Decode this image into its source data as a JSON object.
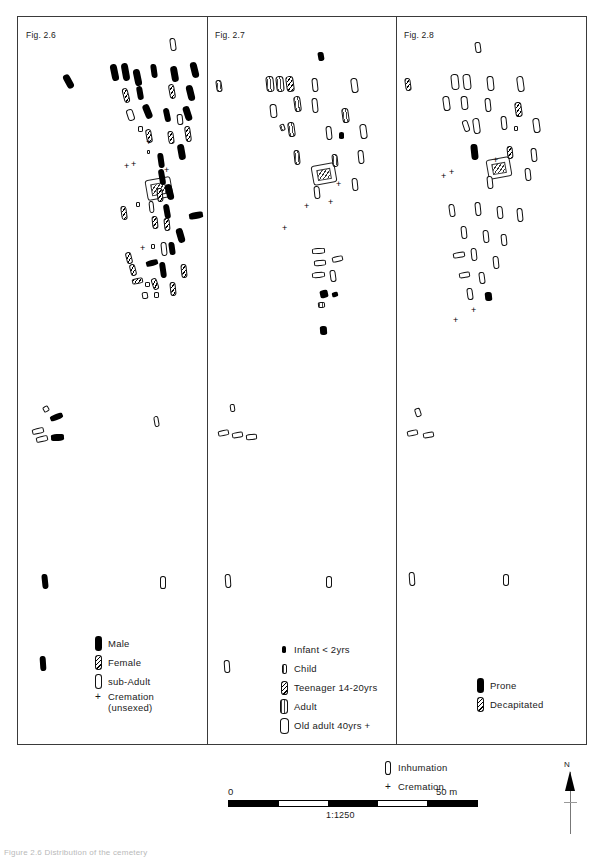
{
  "figure": {
    "caption": "Figure 2.6  Distribution of the cemetery",
    "scale": {
      "zero_label": "0",
      "max_label": "50 m",
      "ratio": "1:1250"
    },
    "north": {
      "label": "N",
      "icon": "north-arrow-icon"
    }
  },
  "panels": [
    {
      "id": "fig-2-6",
      "label": "Fig. 2.6",
      "legend_title": "sex",
      "legend": [
        {
          "symbol": "solid",
          "label": "Male"
        },
        {
          "symbol": "hatch",
          "label": "Female"
        },
        {
          "symbol": "open",
          "label": "sub-Adult"
        },
        {
          "symbol": "plus",
          "label": "Cremation\n(unsexed)"
        }
      ]
    },
    {
      "id": "fig-2-7",
      "label": "Fig. 2.7",
      "legend_title": "age",
      "legend": [
        {
          "symbol": "solid-small",
          "label": "Infant < 2yrs"
        },
        {
          "symbol": "open-small",
          "label": "Child"
        },
        {
          "symbol": "hatch",
          "label": "Teenager 14-20yrs"
        },
        {
          "symbol": "dotty",
          "label": "Adult"
        },
        {
          "symbol": "open",
          "label": "Old adult 40yrs +"
        }
      ]
    },
    {
      "id": "fig-2-8",
      "label": "Fig. 2.8",
      "legend_title": "rite",
      "legend": [
        {
          "symbol": "solid",
          "label": "Prone"
        },
        {
          "symbol": "hatch",
          "label": "Decapitated"
        }
      ]
    }
  ],
  "shared_legend": [
    {
      "symbol": "open",
      "label": "Inhumation"
    },
    {
      "symbol": "plus",
      "label": "Cremation"
    }
  ],
  "chart_data": {
    "type": "scatter",
    "panel_1_graves": [
      {
        "x": 47,
        "y": 58,
        "w": 7,
        "h": 15,
        "r": -28,
        "t": "solid"
      },
      {
        "x": 93,
        "y": 48,
        "w": 7,
        "h": 17,
        "r": -12,
        "t": "solid"
      },
      {
        "x": 104,
        "y": 47,
        "w": 7,
        "h": 18,
        "r": -10,
        "t": "solid"
      },
      {
        "x": 116,
        "y": 53,
        "w": 7,
        "h": 17,
        "r": -12,
        "t": "solid"
      },
      {
        "x": 133,
        "y": 48,
        "w": 6,
        "h": 14,
        "r": -8,
        "t": "solid"
      },
      {
        "x": 152,
        "y": 22,
        "w": 6,
        "h": 13,
        "r": -8,
        "t": "open"
      },
      {
        "x": 153,
        "y": 50,
        "w": 7,
        "h": 16,
        "r": -10,
        "t": "solid"
      },
      {
        "x": 173,
        "y": 46,
        "w": 7,
        "h": 16,
        "r": -14,
        "t": "solid"
      },
      {
        "x": 105,
        "y": 72,
        "w": 6,
        "h": 15,
        "r": -14,
        "t": "hatch"
      },
      {
        "x": 119,
        "y": 70,
        "w": 6,
        "h": 14,
        "r": -10,
        "t": "solid"
      },
      {
        "x": 151,
        "y": 68,
        "w": 6,
        "h": 15,
        "r": -10,
        "t": "hatch"
      },
      {
        "x": 169,
        "y": 69,
        "w": 7,
        "h": 16,
        "r": -14,
        "t": "solid"
      },
      {
        "x": 126,
        "y": 88,
        "w": 7,
        "h": 15,
        "r": -22,
        "t": "solid"
      },
      {
        "x": 109,
        "y": 93,
        "w": 7,
        "h": 12,
        "r": -18,
        "t": "open"
      },
      {
        "x": 146,
        "y": 92,
        "w": 6,
        "h": 14,
        "r": -12,
        "t": "solid"
      },
      {
        "x": 166,
        "y": 90,
        "w": 7,
        "h": 15,
        "r": -18,
        "t": "solid"
      },
      {
        "x": 159,
        "y": 98,
        "w": 6,
        "h": 11,
        "r": -6,
        "t": "open"
      },
      {
        "x": 128,
        "y": 113,
        "w": 6,
        "h": 14,
        "r": -10,
        "t": "hatch"
      },
      {
        "x": 150,
        "y": 115,
        "w": 6,
        "h": 13,
        "r": -8,
        "t": "hatch"
      },
      {
        "x": 167,
        "y": 110,
        "w": 6,
        "h": 16,
        "r": -8,
        "t": "hatch"
      },
      {
        "x": 120,
        "y": 110,
        "w": 5,
        "h": 6,
        "r": 0,
        "t": "open"
      },
      {
        "x": 160,
        "y": 128,
        "w": 7,
        "h": 16,
        "r": -10,
        "t": "solid"
      },
      {
        "x": 129,
        "y": 134,
        "w": 3,
        "h": 4,
        "r": 0,
        "t": "open"
      },
      {
        "x": 140,
        "y": 137,
        "w": 6,
        "h": 15,
        "r": -8,
        "t": "solid"
      },
      {
        "x": 141,
        "y": 153,
        "w": 6,
        "h": 16,
        "r": -10,
        "t": "solid"
      },
      {
        "x": 148,
        "y": 168,
        "w": 7,
        "h": 16,
        "r": -14,
        "t": "solid"
      },
      {
        "x": 139,
        "y": 172,
        "w": 6,
        "h": 14,
        "r": -6,
        "t": "hatch"
      },
      {
        "x": 103,
        "y": 190,
        "w": 6,
        "h": 14,
        "r": -8,
        "t": "hatch"
      },
      {
        "x": 131,
        "y": 185,
        "w": 5,
        "h": 12,
        "r": -6,
        "t": "open"
      },
      {
        "x": 146,
        "y": 188,
        "w": 6,
        "h": 15,
        "r": -10,
        "t": "solid"
      },
      {
        "x": 118,
        "y": 186,
        "w": 4,
        "h": 5,
        "r": 0,
        "t": "open"
      },
      {
        "x": 134,
        "y": 200,
        "w": 6,
        "h": 13,
        "r": -6,
        "t": "hatch"
      },
      {
        "x": 146,
        "y": 202,
        "w": 6,
        "h": 13,
        "r": -6,
        "t": "hatch"
      },
      {
        "x": 171,
        "y": 196,
        "w": 14,
        "h": 7,
        "r": -10,
        "t": "solid"
      },
      {
        "x": 159,
        "y": 212,
        "w": 7,
        "h": 15,
        "r": -16,
        "t": "solid"
      },
      {
        "x": 133,
        "y": 228,
        "w": 4,
        "h": 5,
        "r": 0,
        "t": "open"
      },
      {
        "x": 143,
        "y": 226,
        "w": 6,
        "h": 14,
        "r": -6,
        "t": "open"
      },
      {
        "x": 151,
        "y": 226,
        "w": 6,
        "h": 13,
        "r": -8,
        "t": "solid"
      },
      {
        "x": 108,
        "y": 236,
        "w": 6,
        "h": 12,
        "r": -14,
        "t": "hatch"
      },
      {
        "x": 112,
        "y": 248,
        "w": 6,
        "h": 12,
        "r": -14,
        "t": "hatch"
      },
      {
        "x": 128,
        "y": 244,
        "w": 12,
        "h": 6,
        "r": -16,
        "t": "solid"
      },
      {
        "x": 142,
        "y": 246,
        "w": 6,
        "h": 16,
        "r": -8,
        "t": "solid"
      },
      {
        "x": 163,
        "y": 248,
        "w": 6,
        "h": 14,
        "r": -6,
        "t": "hatch"
      },
      {
        "x": 114,
        "y": 262,
        "w": 11,
        "h": 6,
        "r": -12,
        "t": "hatch"
      },
      {
        "x": 127,
        "y": 266,
        "w": 5,
        "h": 5,
        "r": 0,
        "t": "open"
      },
      {
        "x": 134,
        "y": 262,
        "w": 6,
        "h": 12,
        "r": -18,
        "t": "hatch"
      },
      {
        "x": 152,
        "y": 266,
        "w": 6,
        "h": 14,
        "r": -6,
        "t": "hatch"
      },
      {
        "x": 124,
        "y": 276,
        "w": 6,
        "h": 7,
        "r": -10,
        "t": "open"
      },
      {
        "x": 136,
        "y": 276,
        "w": 5,
        "h": 6,
        "r": 0,
        "t": "open"
      },
      {
        "x": 25,
        "y": 390,
        "w": 6,
        "h": 6,
        "r": -30,
        "t": "open"
      },
      {
        "x": 32,
        "y": 398,
        "w": 13,
        "h": 6,
        "r": -22,
        "t": "solid"
      },
      {
        "x": 14,
        "y": 412,
        "w": 12,
        "h": 6,
        "r": -14,
        "t": "open"
      },
      {
        "x": 18,
        "y": 420,
        "w": 12,
        "h": 6,
        "r": -14,
        "t": "open"
      },
      {
        "x": 33,
        "y": 418,
        "w": 13,
        "h": 7,
        "r": -4,
        "t": "solid"
      },
      {
        "x": 136,
        "y": 400,
        "w": 5,
        "h": 11,
        "r": -10,
        "t": "open"
      },
      {
        "x": 24,
        "y": 558,
        "w": 6,
        "h": 15,
        "r": -6,
        "t": "solid"
      },
      {
        "x": 142,
        "y": 560,
        "w": 6,
        "h": 13,
        "r": 0,
        "t": "open"
      },
      {
        "x": 22,
        "y": 640,
        "w": 6,
        "h": 15,
        "r": -4,
        "t": "solid"
      }
    ],
    "panel_2_graves": [
      {
        "x": 110,
        "y": 36,
        "w": 6,
        "h": 9,
        "r": -10,
        "t": "solid"
      },
      {
        "x": 8,
        "y": 64,
        "w": 6,
        "h": 12,
        "r": -8,
        "t": "dotty"
      },
      {
        "x": 58,
        "y": 60,
        "w": 8,
        "h": 16,
        "r": -6,
        "t": "dotty"
      },
      {
        "x": 68,
        "y": 60,
        "w": 8,
        "h": 16,
        "r": -6,
        "t": "dotty"
      },
      {
        "x": 78,
        "y": 60,
        "w": 8,
        "h": 16,
        "r": -8,
        "t": "hatch"
      },
      {
        "x": 104,
        "y": 62,
        "w": 6,
        "h": 14,
        "r": -6,
        "t": "open"
      },
      {
        "x": 143,
        "y": 62,
        "w": 7,
        "h": 15,
        "r": -8,
        "t": "open"
      },
      {
        "x": 86,
        "y": 80,
        "w": 7,
        "h": 16,
        "r": -8,
        "t": "dotty"
      },
      {
        "x": 104,
        "y": 82,
        "w": 6,
        "h": 15,
        "r": -6,
        "t": "open"
      },
      {
        "x": 62,
        "y": 88,
        "w": 7,
        "h": 14,
        "r": -6,
        "t": "open"
      },
      {
        "x": 134,
        "y": 92,
        "w": 7,
        "h": 15,
        "r": -8,
        "t": "dotty"
      },
      {
        "x": 72,
        "y": 108,
        "w": 5,
        "h": 7,
        "r": -20,
        "t": "dotty"
      },
      {
        "x": 80,
        "y": 106,
        "w": 7,
        "h": 15,
        "r": -8,
        "t": "dotty"
      },
      {
        "x": 118,
        "y": 110,
        "w": 6,
        "h": 14,
        "r": -6,
        "t": "open"
      },
      {
        "x": 152,
        "y": 108,
        "w": 7,
        "h": 15,
        "r": -8,
        "t": "open"
      },
      {
        "x": 131,
        "y": 116,
        "w": 5,
        "h": 7,
        "r": 0,
        "t": "solid"
      },
      {
        "x": 86,
        "y": 134,
        "w": 6,
        "h": 15,
        "r": -6,
        "t": "dotty"
      },
      {
        "x": 124,
        "y": 138,
        "w": 6,
        "h": 13,
        "r": -6,
        "t": "dotty"
      },
      {
        "x": 150,
        "y": 134,
        "w": 6,
        "h": 14,
        "r": -6,
        "t": "open"
      },
      {
        "x": 144,
        "y": 162,
        "w": 6,
        "h": 13,
        "r": -6,
        "t": "open"
      },
      {
        "x": 106,
        "y": 170,
        "w": 6,
        "h": 13,
        "r": -6,
        "t": "open"
      },
      {
        "x": 104,
        "y": 232,
        "w": 13,
        "h": 6,
        "r": -4,
        "t": "open"
      },
      {
        "x": 106,
        "y": 244,
        "w": 12,
        "h": 6,
        "r": -6,
        "t": "open"
      },
      {
        "x": 124,
        "y": 240,
        "w": 11,
        "h": 6,
        "r": -14,
        "t": "open"
      },
      {
        "x": 104,
        "y": 256,
        "w": 13,
        "h": 6,
        "r": -6,
        "t": "open"
      },
      {
        "x": 122,
        "y": 254,
        "w": 6,
        "h": 12,
        "r": -8,
        "t": "open"
      },
      {
        "x": 112,
        "y": 274,
        "w": 8,
        "h": 8,
        "r": -12,
        "t": "solid"
      },
      {
        "x": 124,
        "y": 276,
        "w": 6,
        "h": 5,
        "r": -16,
        "t": "solid"
      },
      {
        "x": 110,
        "y": 286,
        "w": 7,
        "h": 6,
        "r": -6,
        "t": "dotty"
      },
      {
        "x": 112,
        "y": 310,
        "w": 7,
        "h": 9,
        "r": -4,
        "t": "solid"
      },
      {
        "x": 22,
        "y": 388,
        "w": 5,
        "h": 8,
        "r": -8,
        "t": "open"
      },
      {
        "x": 10,
        "y": 414,
        "w": 11,
        "h": 6,
        "r": -12,
        "t": "open"
      },
      {
        "x": 24,
        "y": 416,
        "w": 11,
        "h": 6,
        "r": -10,
        "t": "open"
      },
      {
        "x": 38,
        "y": 418,
        "w": 11,
        "h": 6,
        "r": -6,
        "t": "open"
      },
      {
        "x": 17,
        "y": 558,
        "w": 6,
        "h": 14,
        "r": -4,
        "t": "open"
      },
      {
        "x": 118,
        "y": 560,
        "w": 6,
        "h": 12,
        "r": 0,
        "t": "open"
      },
      {
        "x": 16,
        "y": 644,
        "w": 6,
        "h": 13,
        "r": -4,
        "t": "open"
      }
    ],
    "panel_3_graves": [
      {
        "x": 78,
        "y": 26,
        "w": 6,
        "h": 11,
        "r": -8,
        "t": "open"
      },
      {
        "x": 8,
        "y": 62,
        "w": 6,
        "h": 13,
        "r": -8,
        "t": "hatch"
      },
      {
        "x": 54,
        "y": 58,
        "w": 8,
        "h": 16,
        "r": -6,
        "t": "open"
      },
      {
        "x": 66,
        "y": 58,
        "w": 8,
        "h": 16,
        "r": -6,
        "t": "open"
      },
      {
        "x": 90,
        "y": 60,
        "w": 7,
        "h": 15,
        "r": -6,
        "t": "open"
      },
      {
        "x": 120,
        "y": 60,
        "w": 7,
        "h": 16,
        "r": -8,
        "t": "open"
      },
      {
        "x": 46,
        "y": 80,
        "w": 7,
        "h": 15,
        "r": -8,
        "t": "open"
      },
      {
        "x": 64,
        "y": 80,
        "w": 7,
        "h": 14,
        "r": -6,
        "t": "open"
      },
      {
        "x": 88,
        "y": 82,
        "w": 6,
        "h": 14,
        "r": -6,
        "t": "open"
      },
      {
        "x": 118,
        "y": 86,
        "w": 7,
        "h": 15,
        "r": -8,
        "t": "hatch"
      },
      {
        "x": 66,
        "y": 104,
        "w": 6,
        "h": 12,
        "r": -18,
        "t": "open"
      },
      {
        "x": 76,
        "y": 102,
        "w": 7,
        "h": 16,
        "r": -8,
        "t": "open"
      },
      {
        "x": 104,
        "y": 100,
        "w": 6,
        "h": 14,
        "r": -6,
        "t": "open"
      },
      {
        "x": 136,
        "y": 102,
        "w": 7,
        "h": 15,
        "r": -8,
        "t": "open"
      },
      {
        "x": 117,
        "y": 110,
        "w": 4,
        "h": 5,
        "r": 0,
        "t": "open"
      },
      {
        "x": 74,
        "y": 128,
        "w": 7,
        "h": 16,
        "r": -6,
        "t": "solid"
      },
      {
        "x": 110,
        "y": 130,
        "w": 6,
        "h": 13,
        "r": -6,
        "t": "hatch"
      },
      {
        "x": 134,
        "y": 132,
        "w": 6,
        "h": 14,
        "r": -6,
        "t": "open"
      },
      {
        "x": 128,
        "y": 152,
        "w": 6,
        "h": 13,
        "r": -6,
        "t": "open"
      },
      {
        "x": 90,
        "y": 160,
        "w": 6,
        "h": 13,
        "r": -6,
        "t": "open"
      },
      {
        "x": 52,
        "y": 188,
        "w": 6,
        "h": 13,
        "r": -8,
        "t": "open"
      },
      {
        "x": 78,
        "y": 186,
        "w": 6,
        "h": 14,
        "r": -6,
        "t": "open"
      },
      {
        "x": 100,
        "y": 190,
        "w": 6,
        "h": 13,
        "r": -6,
        "t": "open"
      },
      {
        "x": 120,
        "y": 192,
        "w": 6,
        "h": 14,
        "r": -6,
        "t": "open"
      },
      {
        "x": 64,
        "y": 210,
        "w": 6,
        "h": 13,
        "r": -6,
        "t": "open"
      },
      {
        "x": 86,
        "y": 214,
        "w": 6,
        "h": 13,
        "r": -6,
        "t": "open"
      },
      {
        "x": 104,
        "y": 218,
        "w": 6,
        "h": 12,
        "r": -6,
        "t": "open"
      },
      {
        "x": 56,
        "y": 236,
        "w": 12,
        "h": 6,
        "r": -10,
        "t": "open"
      },
      {
        "x": 74,
        "y": 232,
        "w": 6,
        "h": 13,
        "r": -6,
        "t": "open"
      },
      {
        "x": 96,
        "y": 240,
        "w": 6,
        "h": 13,
        "r": -6,
        "t": "open"
      },
      {
        "x": 62,
        "y": 256,
        "w": 11,
        "h": 6,
        "r": -10,
        "t": "open"
      },
      {
        "x": 82,
        "y": 256,
        "w": 6,
        "h": 12,
        "r": -8,
        "t": "open"
      },
      {
        "x": 70,
        "y": 272,
        "w": 6,
        "h": 12,
        "r": -8,
        "t": "open"
      },
      {
        "x": 88,
        "y": 276,
        "w": 7,
        "h": 9,
        "r": -6,
        "t": "solid"
      },
      {
        "x": 18,
        "y": 392,
        "w": 6,
        "h": 9,
        "r": -18,
        "t": "open"
      },
      {
        "x": 10,
        "y": 414,
        "w": 11,
        "h": 6,
        "r": -12,
        "t": "open"
      },
      {
        "x": 26,
        "y": 416,
        "w": 11,
        "h": 6,
        "r": -10,
        "t": "open"
      },
      {
        "x": 12,
        "y": 556,
        "w": 6,
        "h": 14,
        "r": -4,
        "t": "open"
      },
      {
        "x": 106,
        "y": 558,
        "w": 6,
        "h": 12,
        "r": 0,
        "t": "open"
      }
    ],
    "panel_1_cremations": [
      {
        "x": 128,
        "y": 122
      },
      {
        "x": 106,
        "y": 146
      },
      {
        "x": 113,
        "y": 144
      },
      {
        "x": 146,
        "y": 150
      },
      {
        "x": 122,
        "y": 228
      }
    ],
    "panel_2_cremations": [
      {
        "x": 96,
        "y": 186
      },
      {
        "x": 74,
        "y": 208
      },
      {
        "x": 128,
        "y": 164
      },
      {
        "x": 120,
        "y": 182
      }
    ],
    "panel_3_cremations": [
      {
        "x": 74,
        "y": 290
      },
      {
        "x": 56,
        "y": 300
      },
      {
        "x": 44,
        "y": 156
      },
      {
        "x": 52,
        "y": 152
      },
      {
        "x": 96,
        "y": 140
      }
    ]
  }
}
